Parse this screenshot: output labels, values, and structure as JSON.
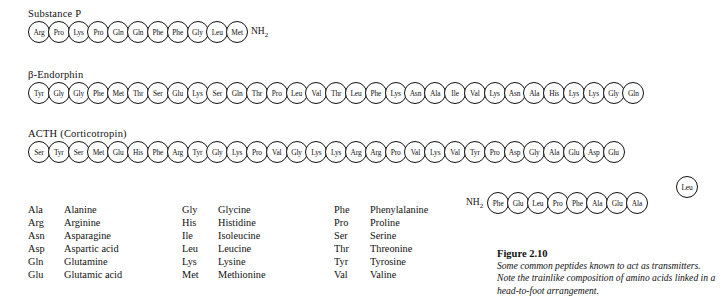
{
  "peptides": [
    {
      "name": "substance-p",
      "title": "Substance P",
      "residues": [
        "Arg",
        "Pro",
        "Lys",
        "Pro",
        "Gln",
        "Gln",
        "Phe",
        "Phe",
        "Gly",
        "Leu",
        "Met"
      ],
      "c_terminal": "NH2"
    },
    {
      "name": "beta-endorphin",
      "title": "β-Endorphin",
      "residues": [
        "Tyr",
        "Gly",
        "Gly",
        "Phe",
        "Met",
        "Thr",
        "Ser",
        "Glu",
        "Lys",
        "Ser",
        "Gln",
        "Thr",
        "Pro",
        "Leu",
        "Val",
        "Thr",
        "Leu",
        "Phe",
        "Lys",
        "Asn",
        "Ala",
        "Ile",
        "Val",
        "Lys",
        "Asn",
        "Ala",
        "His",
        "Lys",
        "Lys",
        "Gly",
        "Gln"
      ],
      "c_terminal": ""
    },
    {
      "name": "acth",
      "title": "ACTH (Corticotropin)",
      "residues": [
        "Ser",
        "Tyr",
        "Ser",
        "Met",
        "Glu",
        "His",
        "Phe",
        "Arg",
        "Tyr",
        "Gly",
        "Lys",
        "Pro",
        "Val",
        "Gly",
        "Lys",
        "Lys",
        "Arg",
        "Arg",
        "Pro",
        "Val",
        "Lys",
        "Val",
        "Tyr",
        "Pro",
        "Asp",
        "Gly",
        "Ala",
        "Glu",
        "Asp",
        "Glu"
      ],
      "corner_residue": "Leu",
      "wrap_residues": [
        "Phe",
        "Glu",
        "Leu",
        "Pro",
        "Phe",
        "Ala",
        "Glu",
        "Ala"
      ],
      "wrap_terminal": "NH2"
    }
  ],
  "legend": {
    "rows": [
      {
        "a1": "Ala",
        "n1": "Alanine",
        "a2": "Gly",
        "n2": "Glycine",
        "a3": "Phe",
        "n3": "Phenylalanine"
      },
      {
        "a1": "Arg",
        "n1": "Arginine",
        "a2": "His",
        "n2": "Histidine",
        "a3": "Pro",
        "n3": "Proline"
      },
      {
        "a1": "Asn",
        "n1": "Asparagine",
        "a2": "Ile",
        "n2": "Isoleucine",
        "a3": "Ser",
        "n3": "Serine"
      },
      {
        "a1": "Asp",
        "n1": "Aspartic acid",
        "a2": "Leu",
        "n2": "Leucine",
        "a3": "Thr",
        "n3": "Threonine"
      },
      {
        "a1": "Gln",
        "n1": "Glutamine",
        "a2": "Lys",
        "n2": "Lysine",
        "a3": "Tyr",
        "n3": "Tyrosine"
      },
      {
        "a1": "Glu",
        "n1": "Glutamic acid",
        "a2": "Met",
        "n2": "Methionine",
        "a3": "Val",
        "n3": "Valine"
      }
    ]
  },
  "caption": {
    "number": "Figure 2.10",
    "text": "Some common peptides known to act as transmitters. Note the trainlike composition of amino acids linked in a head-to-foot arrangement."
  }
}
